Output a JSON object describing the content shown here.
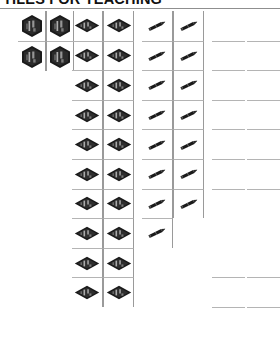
{
  "document": {
    "heading": "TILES FOR TEACHING",
    "heading_rule_color": "#8f8f8f",
    "background_color": "#ffffff",
    "ink_color": "#151515",
    "grid_line_color": "#9a9a9a"
  },
  "grid": {
    "columns": [
      {
        "index": 1,
        "name": "shield-tile-column-1",
        "icon": "shield-tile-icon",
        "x": 18,
        "width": 28,
        "row_height": 30,
        "row_count": 2,
        "cells": [
          "shield-tile-icon",
          "shield-tile-icon"
        ]
      },
      {
        "index": 2,
        "name": "shield-tile-column-2",
        "icon": "shield-tile-icon",
        "x": 46,
        "width": 28,
        "row_height": 30,
        "row_count": 2,
        "cells": [
          "shield-tile-icon",
          "shield-tile-icon"
        ]
      },
      {
        "index": 3,
        "name": "diamond-tile-column-1",
        "icon": "diamond-tile-icon",
        "x": 72,
        "width": 31,
        "row_height": 29.6,
        "row_count": 10,
        "cells": [
          "diamond-tile-icon",
          "diamond-tile-icon",
          "diamond-tile-icon",
          "diamond-tile-icon",
          "diamond-tile-icon",
          "diamond-tile-icon",
          "diamond-tile-icon",
          "diamond-tile-icon",
          "diamond-tile-icon",
          "diamond-tile-icon"
        ]
      },
      {
        "index": 4,
        "name": "diamond-tile-column-2",
        "icon": "diamond-tile-icon",
        "x": 103,
        "width": 31,
        "row_height": 29.6,
        "row_count": 10,
        "cells": [
          "diamond-tile-icon",
          "diamond-tile-icon",
          "diamond-tile-icon",
          "diamond-tile-icon",
          "diamond-tile-icon",
          "diamond-tile-icon",
          "diamond-tile-icon",
          "diamond-tile-icon",
          "diamond-tile-icon",
          "diamond-tile-icon"
        ]
      },
      {
        "index": 5,
        "name": "pencil-tile-column-1",
        "icon": "pencil-icon",
        "x": 142,
        "width": 31,
        "row_height": 29.6,
        "row_count": 8,
        "cells": [
          "pencil-icon",
          "pencil-icon",
          "pencil-icon",
          "pencil-icon",
          "pencil-icon",
          "pencil-icon",
          "pencil-icon",
          "pencil-icon"
        ]
      },
      {
        "index": 6,
        "name": "pencil-tile-column-2",
        "icon": "pencil-icon",
        "x": 173,
        "width": 31,
        "row_height": 29.6,
        "row_count": 7,
        "cells": [
          "pencil-icon",
          "pencil-icon",
          "pencil-icon",
          "pencil-icon",
          "pencil-icon",
          "pencil-icon",
          "pencil-icon"
        ]
      },
      {
        "index": 7,
        "name": "dot-tile-column-1",
        "icon": "dot-icon",
        "x": 212,
        "width": 33,
        "row_height": 29.6,
        "row_count": 11,
        "cells": [
          "dot-icon",
          "dot-icon",
          "dot-icon",
          "dot-icon",
          "dot-icon",
          "dot-icon",
          "dot-icon",
          "dot-icon",
          "dot-icon",
          "dot-icon",
          "dot-icon"
        ]
      },
      {
        "index": 8,
        "name": "dot-tile-column-2",
        "icon": "dot-icon",
        "x": 247,
        "width": 33,
        "row_height": 29.6,
        "row_count": 11,
        "cells": [
          "dot-icon",
          "dot-icon",
          "dot-icon",
          "dot-icon",
          "dot-icon",
          "dot-icon",
          "dot-icon",
          "dot-icon",
          "dot-icon",
          "dot-icon",
          "dot-icon"
        ]
      }
    ]
  }
}
